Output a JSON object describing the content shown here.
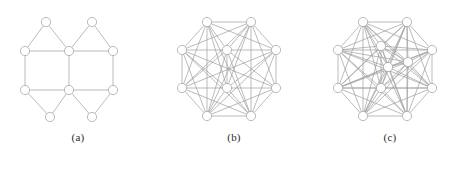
{
  "figure": {
    "background_color": "#ffffff",
    "edge_color": "#9d9d9d",
    "node_fill_color": "#ffffff",
    "node_stroke_color": "#9d9d9d",
    "caption_color": "#2b2b2b"
  },
  "panels": [
    {
      "id": "panel-a",
      "caption": "(a)",
      "node_radius": 4.6,
      "nodes": [
        {
          "id": 0,
          "x": 46,
          "y": 22
        },
        {
          "id": 1,
          "x": 92,
          "y": 22
        },
        {
          "id": 2,
          "x": 25,
          "y": 51
        },
        {
          "id": 3,
          "x": 69,
          "y": 51
        },
        {
          "id": 4,
          "x": 113,
          "y": 51
        },
        {
          "id": 5,
          "x": 25,
          "y": 90
        },
        {
          "id": 6,
          "x": 69,
          "y": 90
        },
        {
          "id": 7,
          "x": 113,
          "y": 90
        },
        {
          "id": 8,
          "x": 50,
          "y": 117
        },
        {
          "id": 9,
          "x": 92,
          "y": 117
        }
      ],
      "edges": [
        [
          0,
          2
        ],
        [
          0,
          3
        ],
        [
          1,
          3
        ],
        [
          1,
          4
        ],
        [
          2,
          3
        ],
        [
          3,
          4
        ],
        [
          2,
          5
        ],
        [
          3,
          6
        ],
        [
          4,
          7
        ],
        [
          5,
          6
        ],
        [
          6,
          7
        ],
        [
          5,
          8
        ],
        [
          6,
          8
        ],
        [
          6,
          9
        ],
        [
          7,
          9
        ]
      ]
    },
    {
      "id": "panel-b",
      "caption": "(b)",
      "node_radius": 4.6,
      "nodes": [
        {
          "id": 0,
          "x": 51,
          "y": 22
        },
        {
          "id": 1,
          "x": 95,
          "y": 22
        },
        {
          "id": 2,
          "x": 26,
          "y": 50
        },
        {
          "id": 3,
          "x": 120,
          "y": 50
        },
        {
          "id": 4,
          "x": 26,
          "y": 88
        },
        {
          "id": 5,
          "x": 120,
          "y": 88
        },
        {
          "id": 6,
          "x": 51,
          "y": 116
        },
        {
          "id": 7,
          "x": 95,
          "y": 116
        },
        {
          "id": 8,
          "x": 71,
          "y": 50
        },
        {
          "id": 9,
          "x": 71,
          "y": 88
        }
      ],
      "edges": [
        [
          0,
          1
        ],
        [
          0,
          2
        ],
        [
          1,
          3
        ],
        [
          2,
          4
        ],
        [
          3,
          5
        ],
        [
          4,
          6
        ],
        [
          5,
          7
        ],
        [
          6,
          7
        ],
        [
          0,
          8
        ],
        [
          1,
          8
        ],
        [
          2,
          8
        ],
        [
          3,
          8
        ],
        [
          8,
          9
        ],
        [
          4,
          9
        ],
        [
          5,
          9
        ],
        [
          6,
          9
        ],
        [
          7,
          9
        ],
        [
          0,
          3
        ],
        [
          0,
          4
        ],
        [
          0,
          6
        ],
        [
          0,
          7
        ],
        [
          0,
          9
        ],
        [
          1,
          2
        ],
        [
          1,
          4
        ],
        [
          1,
          5
        ],
        [
          1,
          6
        ],
        [
          1,
          7
        ],
        [
          1,
          9
        ],
        [
          2,
          5
        ],
        [
          2,
          6
        ],
        [
          2,
          7
        ],
        [
          2,
          9
        ],
        [
          3,
          4
        ],
        [
          3,
          6
        ],
        [
          3,
          7
        ],
        [
          3,
          9
        ],
        [
          4,
          7
        ],
        [
          4,
          8
        ],
        [
          5,
          6
        ],
        [
          5,
          8
        ],
        [
          6,
          8
        ],
        [
          7,
          8
        ]
      ]
    },
    {
      "id": "panel-c",
      "caption": "(c)",
      "node_radius": 4.6,
      "nodes": [
        {
          "id": 0,
          "x": 51,
          "y": 22
        },
        {
          "id": 1,
          "x": 95,
          "y": 22
        },
        {
          "id": 2,
          "x": 26,
          "y": 50
        },
        {
          "id": 3,
          "x": 120,
          "y": 50
        },
        {
          "id": 4,
          "x": 26,
          "y": 88
        },
        {
          "id": 5,
          "x": 120,
          "y": 88
        },
        {
          "id": 6,
          "x": 51,
          "y": 116
        },
        {
          "id": 7,
          "x": 95,
          "y": 116
        },
        {
          "id": 8,
          "x": 69,
          "y": 46
        },
        {
          "id": 9,
          "x": 96,
          "y": 62
        },
        {
          "id": 10,
          "x": 69,
          "y": 88
        },
        {
          "id": 11,
          "x": 76,
          "y": 67
        }
      ],
      "edges": [
        [
          0,
          1
        ],
        [
          0,
          2
        ],
        [
          1,
          3
        ],
        [
          2,
          4
        ],
        [
          3,
          5
        ],
        [
          4,
          6
        ],
        [
          5,
          7
        ],
        [
          6,
          7
        ],
        [
          0,
          3
        ],
        [
          0,
          4
        ],
        [
          0,
          5
        ],
        [
          0,
          6
        ],
        [
          0,
          7
        ],
        [
          1,
          2
        ],
        [
          1,
          4
        ],
        [
          1,
          5
        ],
        [
          1,
          6
        ],
        [
          1,
          7
        ],
        [
          2,
          3
        ],
        [
          2,
          5
        ],
        [
          2,
          6
        ],
        [
          2,
          7
        ],
        [
          3,
          4
        ],
        [
          3,
          6
        ],
        [
          3,
          7
        ],
        [
          4,
          5
        ],
        [
          4,
          7
        ],
        [
          5,
          6
        ],
        [
          0,
          8
        ],
        [
          1,
          8
        ],
        [
          2,
          8
        ],
        [
          3,
          8
        ],
        [
          4,
          8
        ],
        [
          5,
          8
        ],
        [
          6,
          8
        ],
        [
          7,
          8
        ],
        [
          0,
          9
        ],
        [
          1,
          9
        ],
        [
          2,
          9
        ],
        [
          3,
          9
        ],
        [
          4,
          9
        ],
        [
          5,
          9
        ],
        [
          6,
          9
        ],
        [
          7,
          9
        ],
        [
          0,
          10
        ],
        [
          1,
          10
        ],
        [
          2,
          10
        ],
        [
          3,
          10
        ],
        [
          4,
          10
        ],
        [
          5,
          10
        ],
        [
          6,
          10
        ],
        [
          7,
          10
        ],
        [
          0,
          11
        ],
        [
          1,
          11
        ],
        [
          2,
          11
        ],
        [
          3,
          11
        ],
        [
          4,
          11
        ],
        [
          5,
          11
        ],
        [
          6,
          11
        ],
        [
          7,
          11
        ],
        [
          8,
          9
        ],
        [
          8,
          10
        ],
        [
          8,
          11
        ],
        [
          9,
          10
        ],
        [
          9,
          11
        ],
        [
          10,
          11
        ]
      ]
    }
  ]
}
